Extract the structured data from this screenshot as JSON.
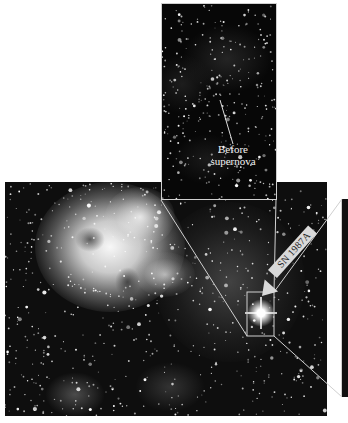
{
  "figure": {
    "panels": {
      "main": {
        "description": "Tarantula Nebula region with supernova",
        "position": [
          5,
          182,
          322,
          234
        ]
      },
      "top_inset": {
        "description": "Same field before supernova",
        "position": [
          161,
          3,
          116,
          197
        ]
      },
      "side_inset": {
        "description": "Cropped zoomed panel (partially visible)",
        "position": [
          341,
          199,
          6,
          198
        ]
      }
    },
    "annotations": {
      "before_label_line1": "Before",
      "before_label_line2": "supernova",
      "supernova_label": "SN 1987A"
    },
    "colors": {
      "background": "#ffffff",
      "sky": "#0e0e0e",
      "nebula": "#f0f0f0",
      "lines": "#d0d0d0",
      "arrow": "#d9d9d9"
    }
  }
}
